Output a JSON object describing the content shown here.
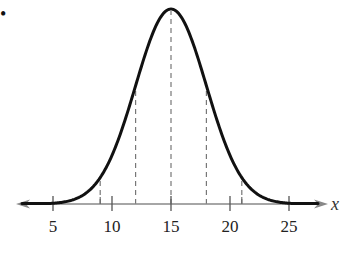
{
  "chart_data": {
    "type": "line",
    "title": "",
    "mean": 15,
    "std_dev": 3,
    "xlabel": "x",
    "ylabel": "",
    "xlim": [
      1.5,
      28
    ],
    "x_ticks": [
      5,
      10,
      15,
      20,
      25
    ],
    "x_tick_labels": [
      "5",
      "10",
      "15",
      "20",
      "25"
    ],
    "minor_ticks": [
      9,
      21
    ],
    "dashed_reference_lines": [
      9,
      12,
      15,
      18,
      21
    ],
    "grid": false,
    "legend": null,
    "series": [
      {
        "name": "normal density",
        "x": [
          3,
          5,
          7,
          9,
          11,
          12,
          13,
          15,
          17,
          18,
          19,
          21,
          23,
          25,
          27
        ],
        "relative_height": [
          0.0003,
          0.0039,
          0.0286,
          0.1353,
          0.4111,
          0.6065,
          0.8007,
          1.0,
          0.8007,
          0.6065,
          0.4111,
          0.1353,
          0.0286,
          0.0039,
          0.0003
        ]
      }
    ]
  },
  "bullet": "•",
  "axis": {
    "var_label": "x"
  }
}
